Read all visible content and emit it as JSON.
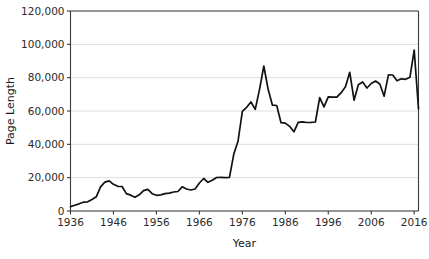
{
  "chart_data": {
    "type": "line",
    "title": "",
    "xlabel": "Year",
    "ylabel": "Page Length",
    "xlim": [
      1936,
      2017
    ],
    "ylim": [
      0,
      120000
    ],
    "grid": true,
    "legend": "none",
    "series_name": "Page Length",
    "line_color": "#111111",
    "grid_color": "#d4d4d4",
    "axis_color": "#3a3a3a",
    "ytick_labels": [
      "0",
      "20,000",
      "40,000",
      "60,000",
      "80,000",
      "100,000",
      "120,000"
    ],
    "ytick_values": [
      0,
      20000,
      40000,
      60000,
      80000,
      100000,
      120000
    ],
    "xtick_labels": [
      "1936",
      "1946",
      "1956",
      "1966",
      "1976",
      "1986",
      "1996",
      "2006",
      "2016"
    ],
    "xtick_values": [
      1936,
      1946,
      1956,
      1966,
      1976,
      1986,
      1996,
      2006,
      2016
    ],
    "x": [
      1936,
      1937,
      1938,
      1939,
      1940,
      1941,
      1942,
      1943,
      1944,
      1945,
      1946,
      1947,
      1948,
      1949,
      1950,
      1951,
      1952,
      1953,
      1954,
      1955,
      1956,
      1957,
      1958,
      1959,
      1960,
      1961,
      1962,
      1963,
      1964,
      1965,
      1966,
      1967,
      1968,
      1969,
      1970,
      1971,
      1972,
      1973,
      1974,
      1975,
      1976,
      1977,
      1978,
      1979,
      1980,
      1981,
      1982,
      1983,
      1984,
      1985,
      1986,
      1987,
      1988,
      1989,
      1990,
      1991,
      1992,
      1993,
      1994,
      1995,
      1996,
      1997,
      1998,
      1999,
      2000,
      2001,
      2002,
      2003,
      2004,
      2005,
      2006,
      2007,
      2008,
      2009,
      2010,
      2011,
      2012,
      2013,
      2014,
      2015,
      2016,
      2017
    ],
    "y": [
      2620,
      3450,
      4300,
      5300,
      5500,
      6900,
      8500,
      14500,
      17300,
      18100,
      16000,
      14800,
      14700,
      10400,
      9500,
      8200,
      9700,
      12200,
      13000,
      10400,
      9400,
      9700,
      10400,
      10700,
      11400,
      11700,
      14500,
      13200,
      12600,
      13200,
      16800,
      19500,
      17200,
      18400,
      20100,
      20200,
      20000,
      20200,
      34000,
      42000,
      59800,
      62200,
      65400,
      61000,
      73000,
      87000,
      73000,
      63500,
      63300,
      53000,
      52700,
      50800,
      47500,
      53200,
      53500,
      53100,
      53200,
      53400,
      68000,
      62500,
      68500,
      68300,
      68300,
      71000,
      74500,
      83200,
      66500,
      75800,
      77400,
      73800,
      76500,
      78000,
      76200,
      68900,
      81700,
      81600,
      78100,
      79300,
      79000,
      80200,
      96500,
      61300
    ]
  },
  "figure": {
    "width": 429,
    "height": 259
  }
}
